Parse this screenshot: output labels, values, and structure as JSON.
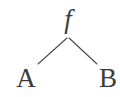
{
  "figure": {
    "kind": "binary-tree-diagram",
    "background_color": "#ffffff",
    "stroke_color": "#4a4a4a",
    "text_color": "#3b3b3b",
    "width": 120,
    "height": 97
  },
  "nodes": {
    "root": {
      "label": "f",
      "role": "root",
      "x": 68,
      "y": 22,
      "style": "italic-serif"
    },
    "left_child": {
      "label": "A",
      "role": "leaf",
      "x": 26,
      "y": 80,
      "style": "roman-serif"
    },
    "right_child": {
      "label": "B",
      "role": "leaf",
      "x": 108,
      "y": 80,
      "style": "roman-serif"
    }
  },
  "edges": [
    {
      "name": "edge-root-to-a",
      "from": "root",
      "to": "left_child",
      "x1": 67,
      "y1": 38,
      "x2": 38,
      "y2": 64
    },
    {
      "name": "edge-root-to-b",
      "from": "root",
      "to": "right_child",
      "x1": 69,
      "y1": 38,
      "x2": 97,
      "y2": 64
    }
  ]
}
